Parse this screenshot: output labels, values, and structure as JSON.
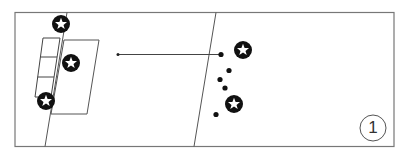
{
  "diagram": {
    "figure_number": "1",
    "colors": {
      "line": "#666666",
      "ink": "#111111",
      "background": "#ffffff"
    },
    "elements": {
      "players_star": [
        {
          "id": "star-top-left",
          "x": 61,
          "y": 24
        },
        {
          "id": "star-middle-left",
          "x": 71,
          "y": 63
        },
        {
          "id": "star-bottom-left",
          "x": 46,
          "y": 101
        },
        {
          "id": "star-top-right",
          "x": 243,
          "y": 50
        },
        {
          "id": "star-bottom-right",
          "x": 234,
          "y": 104
        }
      ],
      "players_dot": [
        {
          "id": "dot-1",
          "x": 221,
          "y": 54
        },
        {
          "id": "dot-2",
          "x": 229,
          "y": 70
        },
        {
          "id": "dot-3",
          "x": 220,
          "y": 79
        },
        {
          "id": "dot-4",
          "x": 225,
          "y": 88
        },
        {
          "id": "dot-5",
          "x": 216,
          "y": 114
        }
      ],
      "pass_arrow": {
        "from": [
          221,
          54
        ],
        "to": [
          117,
          54
        ]
      },
      "icons": [
        "star-icon",
        "dot-icon",
        "arrow-icon"
      ]
    }
  }
}
